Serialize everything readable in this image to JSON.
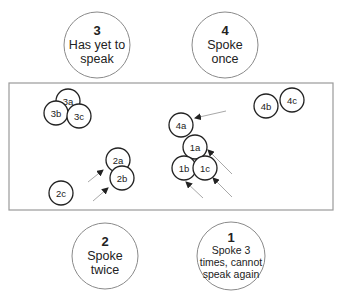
{
  "diagram": {
    "groups": [
      {
        "id": "3",
        "number": "3",
        "lines": [
          "Has yet to",
          "speak"
        ],
        "cx": 97,
        "cy": 45,
        "r": 33
      },
      {
        "id": "4",
        "number": "4",
        "lines": [
          "Spoke",
          "once"
        ],
        "cx": 225,
        "cy": 45,
        "r": 33
      },
      {
        "id": "2",
        "number": "2",
        "lines": [
          "Spoke",
          "twice"
        ],
        "cx": 105,
        "cy": 256,
        "r": 33
      },
      {
        "id": "1",
        "number": "1",
        "lines": [
          "Spoke 3",
          "times, cannot",
          "speak again"
        ],
        "cx": 231,
        "cy": 256,
        "r": 34
      }
    ],
    "frame": {
      "x": 9,
      "y": 83,
      "width": 324,
      "height": 127
    },
    "participants": [
      {
        "label": "3a",
        "cx": 68,
        "cy": 101,
        "r": 12
      },
      {
        "label": "3b",
        "cx": 56,
        "cy": 113,
        "r": 12
      },
      {
        "label": "3c",
        "cx": 79,
        "cy": 116,
        "r": 12
      },
      {
        "label": "4b",
        "cx": 266,
        "cy": 106,
        "r": 12
      },
      {
        "label": "4c",
        "cx": 292,
        "cy": 100,
        "r": 12
      },
      {
        "label": "4a",
        "cx": 181,
        "cy": 125,
        "r": 12
      },
      {
        "label": "1a",
        "cx": 195,
        "cy": 147,
        "r": 12
      },
      {
        "label": "1b",
        "cx": 184,
        "cy": 168,
        "r": 12
      },
      {
        "label": "1c",
        "cx": 205,
        "cy": 168,
        "r": 12
      },
      {
        "label": "2a",
        "cx": 118,
        "cy": 160,
        "r": 12
      },
      {
        "label": "2b",
        "cx": 122,
        "cy": 178,
        "r": 12
      },
      {
        "label": "2c",
        "cx": 61,
        "cy": 193,
        "r": 12
      }
    ],
    "arrows": [
      {
        "x1": 226,
        "y1": 111,
        "x2": 195,
        "y2": 118
      },
      {
        "x1": 232,
        "y1": 174,
        "x2": 208,
        "y2": 150
      },
      {
        "x1": 232,
        "y1": 197,
        "x2": 213,
        "y2": 178
      },
      {
        "x1": 203,
        "y1": 198,
        "x2": 186,
        "y2": 182
      },
      {
        "x1": 88,
        "y1": 182,
        "x2": 103,
        "y2": 170
      },
      {
        "x1": 93,
        "y1": 201,
        "x2": 108,
        "y2": 188
      }
    ]
  }
}
